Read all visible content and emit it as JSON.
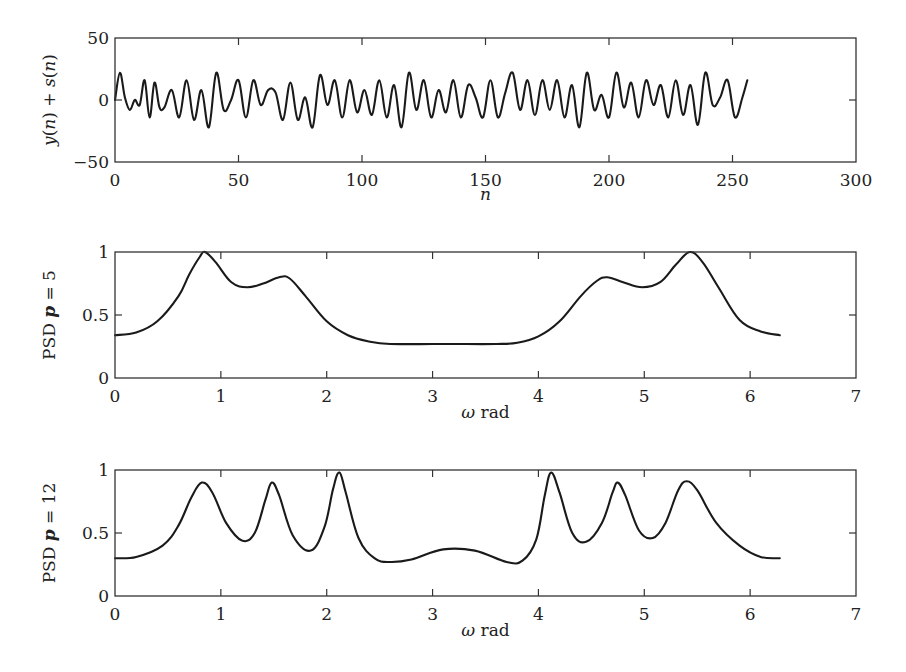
{
  "colors": {
    "line": "#1a1a1a",
    "axes": "#333333",
    "background": "#ffffff"
  },
  "chart_data": [
    {
      "type": "line",
      "title": "",
      "xlabel": "n",
      "ylabel": "y(n) + s(n)",
      "xlim": [
        0,
        300
      ],
      "ylim": [
        -50,
        50
      ],
      "xticks": [
        0,
        50,
        100,
        150,
        200,
        250,
        300
      ],
      "yticks": [
        -50,
        0,
        50
      ],
      "grid": false,
      "legend": null,
      "description": "Noisy multi-sinusoid time series of 256 samples, amplitude roughly within ±25",
      "x": [
        0,
        2,
        4,
        6,
        8,
        10,
        12,
        14,
        16,
        18,
        20,
        23,
        26,
        29,
        32,
        35,
        38,
        41,
        44,
        47,
        50,
        53,
        56,
        59,
        62,
        65,
        68,
        71,
        74,
        77,
        80,
        83,
        86,
        89,
        92,
        95,
        98,
        101,
        104,
        107,
        110,
        113,
        116,
        119,
        122,
        125,
        128,
        131,
        134,
        137,
        140,
        143,
        146,
        149,
        152,
        155,
        158,
        161,
        164,
        167,
        170,
        173,
        176,
        179,
        182,
        185,
        188,
        191,
        194,
        197,
        200,
        203,
        206,
        209,
        212,
        215,
        218,
        221,
        224,
        227,
        230,
        233,
        236,
        239,
        242,
        245,
        248,
        251,
        254,
        256
      ],
      "values": [
        0,
        22,
        2,
        -8,
        0,
        -4,
        16,
        -14,
        14,
        -6,
        -6,
        8,
        -14,
        16,
        -16,
        8,
        -22,
        22,
        -8,
        0,
        16,
        -14,
        16,
        -4,
        8,
        6,
        -16,
        14,
        -16,
        2,
        -22,
        20,
        -4,
        16,
        -14,
        16,
        -10,
        8,
        -12,
        16,
        -14,
        12,
        -22,
        22,
        -8,
        16,
        -14,
        8,
        -10,
        16,
        -14,
        12,
        2,
        -14,
        16,
        -14,
        6,
        22,
        -8,
        16,
        -12,
        16,
        -8,
        16,
        -14,
        12,
        -22,
        22,
        -8,
        4,
        -14,
        22,
        -6,
        14,
        -14,
        16,
        -4,
        12,
        -14,
        16,
        -12,
        12,
        -20,
        22,
        -4,
        2,
        16,
        -14,
        2,
        16
      ]
    },
    {
      "type": "line",
      "title": "",
      "xlabel": "ω rad",
      "ylabel": "PSD p = 5",
      "xlim": [
        0,
        7
      ],
      "ylim": [
        0,
        1
      ],
      "xticks": [
        0,
        1,
        2,
        3,
        4,
        5,
        6,
        7
      ],
      "yticks": [
        0,
        0.5,
        1
      ],
      "grid": false,
      "legend": null,
      "x": [
        0,
        0.2,
        0.4,
        0.6,
        0.7,
        0.8,
        0.85,
        0.95,
        1.1,
        1.25,
        1.4,
        1.55,
        1.65,
        1.8,
        2.0,
        2.2,
        2.4,
        2.6,
        3.0,
        3.2,
        3.6,
        3.8,
        4.0,
        4.2,
        4.4,
        4.55,
        4.65,
        4.8,
        4.98,
        5.15,
        5.3,
        5.43,
        5.55,
        5.7,
        5.9,
        6.1,
        6.28
      ],
      "values": [
        0.34,
        0.36,
        0.45,
        0.65,
        0.82,
        0.96,
        1.0,
        0.92,
        0.76,
        0.72,
        0.75,
        0.8,
        0.79,
        0.65,
        0.45,
        0.34,
        0.29,
        0.27,
        0.27,
        0.27,
        0.27,
        0.28,
        0.33,
        0.45,
        0.65,
        0.77,
        0.8,
        0.76,
        0.72,
        0.76,
        0.9,
        1.0,
        0.92,
        0.72,
        0.46,
        0.37,
        0.34
      ]
    },
    {
      "type": "line",
      "title": "",
      "xlabel": "ω rad",
      "ylabel": "PSD p = 12",
      "xlim": [
        0,
        7
      ],
      "ylim": [
        0,
        1
      ],
      "xticks": [
        0,
        1,
        2,
        3,
        4,
        5,
        6,
        7
      ],
      "yticks": [
        0,
        0.5,
        1
      ],
      "grid": false,
      "legend": null,
      "x": [
        0,
        0.2,
        0.45,
        0.6,
        0.72,
        0.82,
        0.92,
        1.05,
        1.2,
        1.32,
        1.42,
        1.48,
        1.55,
        1.68,
        1.85,
        1.98,
        2.06,
        2.12,
        2.18,
        2.3,
        2.45,
        2.6,
        2.8,
        3.1,
        3.4,
        3.7,
        3.85,
        3.98,
        4.06,
        4.12,
        4.2,
        4.32,
        4.45,
        4.6,
        4.7,
        4.75,
        4.82,
        4.95,
        5.08,
        5.2,
        5.32,
        5.4,
        5.5,
        5.68,
        5.9,
        6.1,
        6.28
      ],
      "values": [
        0.3,
        0.31,
        0.4,
        0.56,
        0.78,
        0.9,
        0.82,
        0.58,
        0.44,
        0.5,
        0.76,
        0.9,
        0.8,
        0.48,
        0.36,
        0.55,
        0.85,
        0.98,
        0.82,
        0.46,
        0.3,
        0.27,
        0.29,
        0.37,
        0.36,
        0.27,
        0.28,
        0.45,
        0.8,
        0.98,
        0.82,
        0.5,
        0.43,
        0.58,
        0.82,
        0.9,
        0.8,
        0.52,
        0.46,
        0.58,
        0.84,
        0.91,
        0.84,
        0.58,
        0.4,
        0.31,
        0.3
      ]
    }
  ]
}
